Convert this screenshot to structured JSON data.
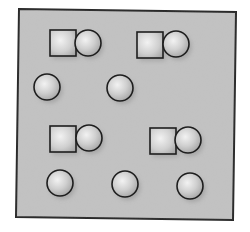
{
  "diagram": {
    "type": "particle-model",
    "colors": {
      "page_background": "#ffffff",
      "box_fill": "#c2c2c2",
      "box_border": "#2a2a2a",
      "shape_outline": "#1e1e1e",
      "shape_highlight": "#f2f2f2",
      "shape_mid": "#cfcfcf",
      "shape_edge": "#a8a8a8",
      "shadow": "#8f8f8f"
    },
    "box": {
      "corners": [
        [
          19,
          9
        ],
        [
          236,
          12
        ],
        [
          233,
          220
        ],
        [
          16,
          217
        ]
      ]
    },
    "molecules": [
      {
        "id": "molecule-1",
        "square": {
          "x": 50,
          "y": 30,
          "size": 26
        },
        "circle": {
          "cx": 88,
          "cy": 43,
          "r": 13
        }
      },
      {
        "id": "molecule-2",
        "square": {
          "x": 137,
          "y": 32,
          "size": 26
        },
        "circle": {
          "cx": 176,
          "cy": 44,
          "r": 13
        }
      },
      {
        "id": "molecule-3",
        "square": {
          "x": 50,
          "y": 126,
          "size": 26
        },
        "circle": {
          "cx": 89,
          "cy": 138,
          "r": 13
        }
      },
      {
        "id": "molecule-4",
        "square": {
          "x": 150,
          "y": 128,
          "size": 26
        },
        "circle": {
          "cx": 188,
          "cy": 140,
          "r": 13
        }
      }
    ],
    "atoms": [
      {
        "id": "atom-1",
        "cx": 47,
        "cy": 87,
        "r": 13
      },
      {
        "id": "atom-2",
        "cx": 120,
        "cy": 88,
        "r": 13
      },
      {
        "id": "atom-3",
        "cx": 60,
        "cy": 183,
        "r": 13
      },
      {
        "id": "atom-4",
        "cx": 125,
        "cy": 184,
        "r": 13
      },
      {
        "id": "atom-5",
        "cx": 190,
        "cy": 186,
        "r": 13
      }
    ],
    "counts": {
      "molecules": 4,
      "single_atoms": 5
    }
  }
}
